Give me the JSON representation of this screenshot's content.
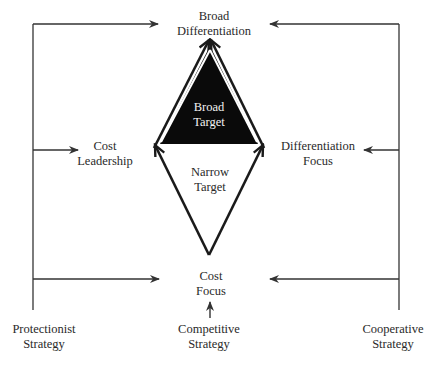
{
  "diagram": {
    "title": "",
    "colors": {
      "line": "#333333",
      "broad_target_fill": "#0a0a0a",
      "background": "#ffffff"
    },
    "nodes": {
      "broad_differentiation": {
        "line1": "Broad",
        "line2": "Differentiation"
      },
      "cost_leadership": {
        "line1": "Cost",
        "line2": "Leadership"
      },
      "differentiation_focus": {
        "line1": "Differentiation",
        "line2": "Focus"
      },
      "cost_focus": {
        "line1": "Cost",
        "line2": "Focus"
      },
      "broad_target": {
        "line1": "Broad",
        "line2": "Target"
      },
      "narrow_target": {
        "line1": "Narrow",
        "line2": "Target"
      }
    },
    "strategies": {
      "protectionist": {
        "line1": "Protectionist",
        "line2": "Strategy"
      },
      "competitive": {
        "line1": "Competitive",
        "line2": "Strategy"
      },
      "cooperative": {
        "line1": "Cooperative",
        "line2": "Strategy"
      }
    },
    "edges": [
      {
        "from": "Protectionist Strategy",
        "to": "Broad Differentiation"
      },
      {
        "from": "Protectionist Strategy",
        "to": "Cost Leadership"
      },
      {
        "from": "Protectionist Strategy",
        "to": "Cost Focus"
      },
      {
        "from": "Cooperative Strategy",
        "to": "Broad Differentiation"
      },
      {
        "from": "Cooperative Strategy",
        "to": "Differentiation Focus"
      },
      {
        "from": "Cooperative Strategy",
        "to": "Cost Focus"
      },
      {
        "from": "Competitive Strategy",
        "to": "Cost Focus"
      },
      {
        "from": "Cost Leadership",
        "to": "Broad Differentiation"
      },
      {
        "from": "Differentiation Focus",
        "to": "Broad Differentiation"
      },
      {
        "from": "Cost Focus",
        "to": "Cost Leadership"
      },
      {
        "from": "Cost Focus",
        "to": "Differentiation Focus"
      }
    ]
  }
}
